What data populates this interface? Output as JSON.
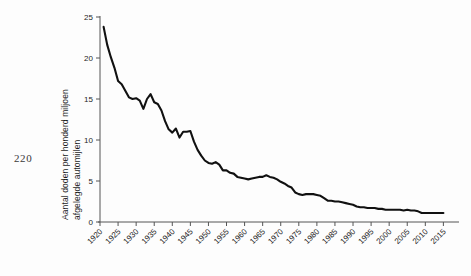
{
  "page": {
    "number": "220"
  },
  "axis": {
    "y_label_line1": "Aantal doden per honderd miljoen",
    "y_label_line2": "afgelegde automijlen",
    "y_ticks": [
      "0",
      "5",
      "10",
      "15",
      "20",
      "25"
    ],
    "x_ticks": [
      "1920",
      "1925",
      "1930",
      "1935",
      "1940",
      "1945",
      "1950",
      "1955",
      "1960",
      "1965",
      "1970",
      "1975",
      "1980",
      "1985",
      "1990",
      "1995",
      "2000",
      "2005",
      "2010",
      "2015"
    ]
  },
  "colors": {
    "line": "#111111",
    "axis": "#555555",
    "background": "#fdfdfd",
    "text": "#1e1e1e"
  },
  "chart_data": {
    "type": "line",
    "title": "",
    "xlabel": "",
    "ylabel": "Aantal doden per honderd miljoen afgelegde automijlen",
    "xlim": [
      1920,
      2016
    ],
    "ylim": [
      0,
      25
    ],
    "grid": false,
    "legend": false,
    "x": [
      1921,
      1922,
      1923,
      1924,
      1925,
      1926,
      1927,
      1928,
      1929,
      1930,
      1931,
      1932,
      1933,
      1934,
      1935,
      1936,
      1937,
      1938,
      1939,
      1940,
      1941,
      1942,
      1943,
      1944,
      1945,
      1946,
      1947,
      1948,
      1949,
      1950,
      1951,
      1952,
      1953,
      1954,
      1955,
      1956,
      1957,
      1958,
      1959,
      1960,
      1961,
      1962,
      1963,
      1964,
      1965,
      1966,
      1967,
      1968,
      1969,
      1970,
      1971,
      1972,
      1973,
      1974,
      1975,
      1976,
      1977,
      1978,
      1979,
      1980,
      1981,
      1982,
      1983,
      1984,
      1985,
      1986,
      1987,
      1988,
      1989,
      1990,
      1991,
      1992,
      1993,
      1994,
      1995,
      1996,
      1997,
      1998,
      1999,
      2000,
      2001,
      2002,
      2003,
      2004,
      2005,
      2006,
      2007,
      2008,
      2009,
      2010,
      2011,
      2012,
      2013,
      2014,
      2015
    ],
    "series": [
      {
        "name": "Dodelijke slachtoffers per honderd miljoen automijlen",
        "values": [
          23.8,
          21.6,
          20.1,
          18.8,
          17.2,
          16.8,
          16.0,
          15.2,
          15.0,
          15.1,
          14.8,
          13.8,
          15.0,
          15.6,
          14.6,
          14.4,
          13.6,
          12.3,
          11.3,
          10.9,
          11.4,
          10.3,
          11.0,
          11.0,
          11.1,
          9.8,
          8.8,
          8.1,
          7.5,
          7.2,
          7.1,
          7.3,
          7.0,
          6.3,
          6.3,
          6.0,
          5.9,
          5.5,
          5.4,
          5.3,
          5.2,
          5.3,
          5.4,
          5.5,
          5.5,
          5.7,
          5.5,
          5.4,
          5.2,
          4.9,
          4.7,
          4.4,
          4.2,
          3.6,
          3.4,
          3.3,
          3.4,
          3.4,
          3.4,
          3.3,
          3.2,
          2.9,
          2.6,
          2.6,
          2.5,
          2.5,
          2.4,
          2.3,
          2.2,
          2.1,
          1.9,
          1.8,
          1.8,
          1.7,
          1.7,
          1.7,
          1.6,
          1.6,
          1.5,
          1.5,
          1.5,
          1.5,
          1.5,
          1.4,
          1.5,
          1.4,
          1.4,
          1.3,
          1.1,
          1.1,
          1.1,
          1.1,
          1.1,
          1.1,
          1.1
        ]
      }
    ]
  }
}
